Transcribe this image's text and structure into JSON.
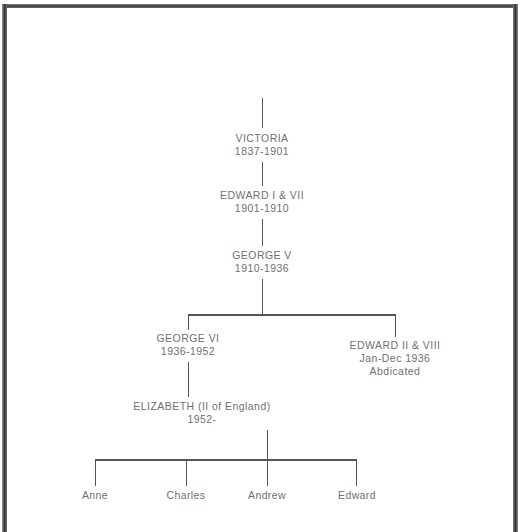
{
  "diagram": {
    "type": "family-tree",
    "line_color": "#555555",
    "text_color": "#6f6f72",
    "background": "#ffffff",
    "frame_color": "#333333",
    "nodes": [
      {
        "id": "victoria",
        "name": "VICTORIA",
        "reign": "1837-1901",
        "note": ""
      },
      {
        "id": "edward7",
        "name": "EDWARD I & VII",
        "reign": "1901-1910",
        "note": ""
      },
      {
        "id": "george5",
        "name": "GEORGE  V",
        "reign": "1910-1936",
        "note": ""
      },
      {
        "id": "george6",
        "name": "GEORGE VI",
        "reign": "1936-1952",
        "note": ""
      },
      {
        "id": "edward8",
        "name": "EDWARD II & VIII",
        "reign": "Jan-Dec 1936",
        "note": "Abdicated"
      },
      {
        "id": "elizabeth",
        "name": "ELIZABETH (II of England)",
        "reign": "1952-",
        "note": ""
      }
    ],
    "children": [
      {
        "id": "anne",
        "name": "Anne"
      },
      {
        "id": "charles",
        "name": "Charles"
      },
      {
        "id": "andrew",
        "name": "Andrew"
      },
      {
        "id": "edward",
        "name": "Edward"
      }
    ]
  }
}
